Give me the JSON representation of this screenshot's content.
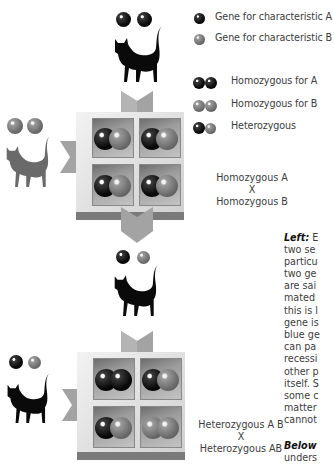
{
  "legend": {
    "genes": [
      {
        "label": "Gene for characteristic A",
        "icon": "dark-gene-ball"
      },
      {
        "label": "Gene for characteristic B",
        "icon": "grey-gene-ball"
      }
    ],
    "genotypes": [
      {
        "label": "Homozygous for A",
        "icons": [
          "dark",
          "dark"
        ]
      },
      {
        "label": "Homozygous for B",
        "icons": [
          "grey",
          "grey"
        ]
      },
      {
        "label": "Heterozygous",
        "icons": [
          "dark",
          "grey"
        ]
      }
    ]
  },
  "cross1": {
    "label_line1": "Homozygous A",
    "label_x": "X",
    "label_line2": "Homozygous B",
    "parent_top": {
      "cat_color": "black",
      "genes": [
        "dark",
        "dark"
      ]
    },
    "parent_left": {
      "cat_color": "grey",
      "genes": [
        "grey",
        "grey"
      ]
    },
    "punnett": [
      [
        "dark",
        "grey"
      ],
      [
        "dark",
        "grey"
      ],
      [
        "dark",
        "grey"
      ],
      [
        "dark",
        "grey"
      ]
    ]
  },
  "cross2": {
    "label_line1": "Heterozygous A B",
    "label_x": "X",
    "label_line2": "Heterozygous AB",
    "parent_top": {
      "cat_color": "black",
      "genes": [
        "dark",
        "grey"
      ]
    },
    "parent_left": {
      "cat_color": "black",
      "genes": [
        "dark",
        "grey"
      ]
    },
    "punnett": [
      [
        "dark",
        "dark"
      ],
      [
        "dark",
        "grey"
      ],
      [
        "dark",
        "grey"
      ],
      [
        "grey",
        "grey"
      ]
    ]
  },
  "caption": {
    "left_heading": "Left:",
    "left_lines": [
      "E",
      "two se",
      "particu",
      "two ge",
      "are sai",
      "mated",
      "this is l",
      "gene is",
      "blue ge",
      "can pa",
      "recessi",
      "other p",
      "itself. S",
      "some c",
      "matter",
      "cannot"
    ],
    "below_heading": "Below",
    "below_lines": [
      "unders"
    ]
  },
  "colors": {
    "gene_a": "#0a0a0a",
    "gene_b": "#7a7a7a",
    "arrow": "#9c9c9c",
    "text": "#3c3c3c"
  }
}
